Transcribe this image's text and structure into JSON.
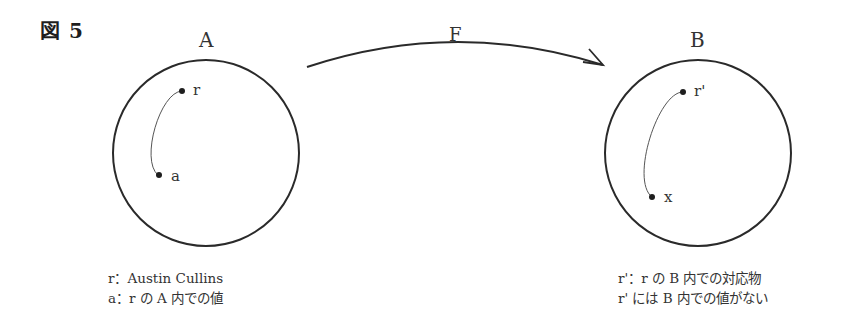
{
  "figure": {
    "label": "図 5"
  },
  "mapping": {
    "label": "F"
  },
  "set_a": {
    "label": "A",
    "points": {
      "r": "r",
      "a": "a"
    },
    "caption": {
      "line1": "r：Austin Cullins",
      "line2": "a：r の A 内での値"
    }
  },
  "set_b": {
    "label": "B",
    "points": {
      "r_prime": "r'",
      "x": "x"
    },
    "caption": {
      "line1": "r'：r の B 内での対応物",
      "line2": "r' には B 内での値がない"
    }
  },
  "colors": {
    "stroke": "#2a2a2a",
    "curve": "#555555",
    "text": "#333333"
  }
}
